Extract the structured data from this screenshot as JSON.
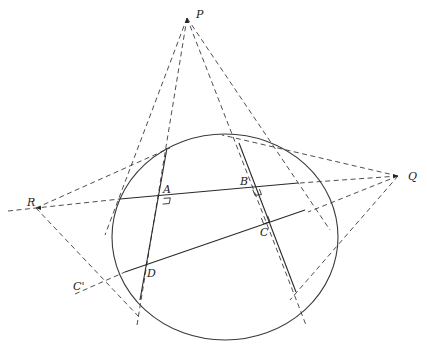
{
  "diagram": {
    "type": "geometry",
    "points": {
      "P": {
        "label": "P",
        "x": 187,
        "y": 18
      },
      "Q": {
        "label": "Q",
        "x": 398,
        "y": 176
      },
      "R": {
        "label": "R",
        "x": 36,
        "y": 208
      },
      "A": {
        "label": "A",
        "x": 162,
        "y": 195
      },
      "B": {
        "label": "B",
        "x": 252,
        "y": 187
      },
      "C": {
        "label": "C",
        "x": 264,
        "y": 225
      },
      "D": {
        "label": "D",
        "x": 147,
        "y": 265
      },
      "C_prime": {
        "label": "C'",
        "x": 74,
        "y": 290
      }
    },
    "labels": {
      "P": "P",
      "Q": "Q",
      "R": "R",
      "A": "A",
      "B": "B",
      "C": "C",
      "D": "D",
      "C_prime": "C'"
    },
    "circle": {
      "cx": 225,
      "cy": 237,
      "rx": 113,
      "ry": 103
    },
    "solid_lines": [
      {
        "name": "chord-left",
        "x1": 167,
        "y1": 148,
        "x2": 140,
        "y2": 300
      },
      {
        "name": "chord-right",
        "x1": 239,
        "y1": 143,
        "x2": 296,
        "y2": 292
      },
      {
        "name": "line-AB",
        "x1": 120,
        "y1": 199,
        "x2": 298,
        "y2": 183
      },
      {
        "name": "line-CD",
        "x1": 125,
        "y1": 272,
        "x2": 305,
        "y2": 210
      }
    ],
    "dashed_lines": [
      {
        "from": "P",
        "x1": 187,
        "y1": 18,
        "x2": 105,
        "y2": 235
      },
      {
        "from": "P",
        "x1": 187,
        "y1": 18,
        "x2": 137,
        "y2": 325
      },
      {
        "from": "P",
        "x1": 187,
        "y1": 18,
        "x2": 306,
        "y2": 325
      },
      {
        "from": "P",
        "x1": 187,
        "y1": 18,
        "x2": 330,
        "y2": 230
      },
      {
        "from": "Q",
        "x1": 398,
        "y1": 176,
        "x2": 222,
        "y2": 135
      },
      {
        "from": "Q",
        "x1": 398,
        "y1": 176,
        "x2": 300,
        "y2": 183
      },
      {
        "from": "Q",
        "x1": 398,
        "y1": 176,
        "x2": 308,
        "y2": 212
      },
      {
        "from": "Q",
        "x1": 398,
        "y1": 176,
        "x2": 290,
        "y2": 300
      },
      {
        "from": "R",
        "x1": 8,
        "y1": 211,
        "x2": 120,
        "y2": 199
      },
      {
        "from": "R",
        "x1": 36,
        "y1": 208,
        "x2": 170,
        "y2": 148
      },
      {
        "from": "R",
        "x1": 36,
        "y1": 208,
        "x2": 140,
        "y2": 318
      },
      {
        "from": "C'",
        "x1": 75,
        "y1": 294,
        "x2": 125,
        "y2": 272
      }
    ],
    "right_angle_marks": [
      "A",
      "B",
      "C"
    ]
  }
}
